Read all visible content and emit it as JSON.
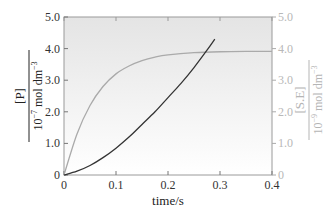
{
  "chart_data": {
    "type": "line",
    "title": "",
    "xlabel": "time/s",
    "ylabel_left": {
      "numerator": "[P]",
      "denominator": "10^-7 mol dm^-3"
    },
    "ylabel_right": {
      "numerator": "[S.E]",
      "denominator": "10^-9 mol dm^-3"
    },
    "xlim": [
      0,
      0.4
    ],
    "ylim_left": [
      0,
      5.0
    ],
    "ylim_right": [
      0,
      5.0
    ],
    "x_ticks": [
      "0",
      "0.1",
      "0.2",
      "0.3",
      "0.4"
    ],
    "y_ticks_left": [
      "0",
      "1.0",
      "2.0",
      "3.0",
      "4.0",
      "5.0"
    ],
    "y_ticks_right": [
      "0",
      "1.0",
      "2.0",
      "3.0",
      "4.0",
      "5.0"
    ],
    "grid": false,
    "series": [
      {
        "name": "[P]",
        "axis": "left",
        "color": "#333333",
        "x": [
          0,
          0.025,
          0.05,
          0.075,
          0.1,
          0.125,
          0.15,
          0.175,
          0.2,
          0.225,
          0.25,
          0.275,
          0.29
        ],
        "y": [
          0,
          0.12,
          0.3,
          0.55,
          0.85,
          1.2,
          1.6,
          2.0,
          2.45,
          2.9,
          3.4,
          3.95,
          4.3
        ]
      },
      {
        "name": "[S.E]",
        "axis": "right",
        "color": "#aaaaaa",
        "x": [
          0,
          0.025,
          0.05,
          0.075,
          0.1,
          0.125,
          0.15,
          0.175,
          0.2,
          0.25,
          0.3,
          0.35,
          0.4
        ],
        "y": [
          0,
          1.3,
          2.2,
          2.8,
          3.2,
          3.45,
          3.62,
          3.73,
          3.8,
          3.87,
          3.9,
          3.91,
          3.91
        ]
      }
    ]
  },
  "labels": {
    "xlabel": "time/s",
    "left_num": "[P]",
    "left_den": "10",
    "left_den_exp": "−7",
    "left_den_rest": " mol dm",
    "left_den_exp2": "−3",
    "right_num": "[S.E]",
    "right_den": "10",
    "right_den_exp": "−9",
    "right_den_rest": " mol dm",
    "right_den_exp2": "−3"
  }
}
